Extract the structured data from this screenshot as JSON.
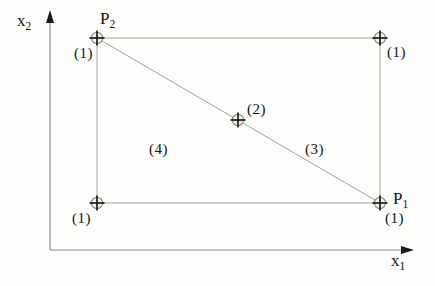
{
  "figure": {
    "labels": {
      "y_axis": {
        "base": "x",
        "sub": "2"
      },
      "x_axis": {
        "base": "x",
        "sub": "1"
      },
      "p2": {
        "base": "P",
        "sub": "2"
      },
      "p1": {
        "base": "P",
        "sub": "1"
      },
      "weight_p2": "(1)",
      "weight_top_right": "(1)",
      "weight_center": "(2)",
      "weight_bottom_left": "(1)",
      "weight_p1": "(1)",
      "region_upper": "(3)",
      "region_lower": "(4)"
    },
    "geometry": {
      "origin": {
        "x": 50,
        "y": 250
      },
      "y_axis_top": 10,
      "x_axis_end": 414,
      "rect": {
        "left": 97,
        "top": 38,
        "right": 380,
        "bottom": 203
      },
      "center_point": {
        "x": 238,
        "y": 120
      },
      "marker_radius": 5.6,
      "cross_half": 7.5
    },
    "colors": {
      "line": "#a3a3a0",
      "axis": "#8e8e8b",
      "ink": "#1a1a1a",
      "marker_fill": "#f4f4f1"
    }
  }
}
